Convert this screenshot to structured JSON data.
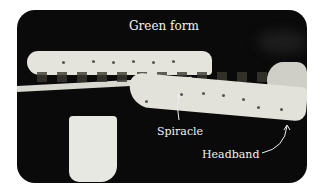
{
  "figure": {
    "labels": {
      "title": "Green form",
      "spiracle": "Spiracle",
      "headband": "Headband"
    }
  }
}
